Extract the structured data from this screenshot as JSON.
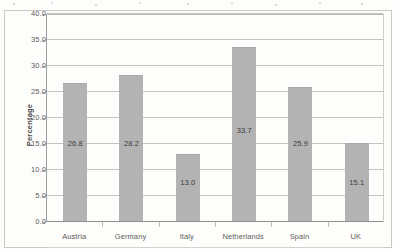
{
  "chart_data": {
    "type": "bar",
    "title": "",
    "xlabel": "",
    "ylabel": "Percentage",
    "categories": [
      "Austria",
      "Germany",
      "Italy",
      "Netherlands",
      "Spain",
      "UK"
    ],
    "values": [
      26.8,
      28.2,
      13.0,
      33.7,
      25.9,
      15.1
    ],
    "value_labels": [
      "26.8",
      "28.2",
      "13.0",
      "33.7",
      "25.9",
      "15.1"
    ],
    "ylim": [
      0.0,
      40.0
    ],
    "ytick_values": [
      0.0,
      5.0,
      10.0,
      15.0,
      20.0,
      25.0,
      30.0,
      35.0,
      40.0
    ],
    "ytick_labels": [
      "0.0",
      "5.0",
      "10.0",
      "15.0",
      "20.0",
      "25.0",
      "30.0",
      "35.0",
      "40.0"
    ],
    "label_anchor_values": [
      15.0,
      15.0,
      7.5,
      17.5,
      15.0,
      7.5
    ],
    "grid": true,
    "grid_axis": "y",
    "legend": false,
    "legend_position": "none",
    "bar_color": "#b3b3b3",
    "gridline_color": "#c4c4c2",
    "axis_color": "#8f8f8d",
    "text_color": "#5d5d5b",
    "background_color": "#fdfdfc"
  }
}
